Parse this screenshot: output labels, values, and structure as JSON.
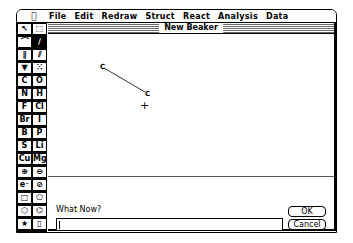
{
  "menubar": {
    "apple_icon": "",
    "items": [
      "File",
      "Edit",
      "Redraw",
      "Struct",
      "React",
      "Analysis",
      "Data"
    ]
  },
  "palette": {
    "rows": [
      [
        {
          "label": "↖",
          "name": "arrow-select-tool"
        },
        {
          "label": "⬚",
          "name": "marquee-select-tool"
        }
      ],
      [
        {
          "label": "⌒",
          "name": "lasso-tool"
        },
        {
          "label": "∕",
          "name": "single-bond-tool",
          "selected": true
        }
      ],
      [
        {
          "label": "∥",
          "name": "double-bond-tool"
        },
        {
          "label": "⫽",
          "name": "triple-bond-tool"
        }
      ],
      [
        {
          "label": "▼",
          "name": "wedge-bond-tool"
        },
        {
          "label": "⁙",
          "name": "hash-bond-tool"
        }
      ],
      [
        {
          "label": "C",
          "name": "carbon-tool"
        },
        {
          "label": "O",
          "name": "oxygen-tool"
        }
      ],
      [
        {
          "label": "N",
          "name": "nitrogen-tool"
        },
        {
          "label": "H",
          "name": "hydrogen-tool"
        }
      ],
      [
        {
          "label": "F",
          "name": "fluorine-tool"
        },
        {
          "label": "Cl",
          "name": "chlorine-tool"
        }
      ],
      [
        {
          "label": "Br",
          "name": "bromine-tool"
        },
        {
          "label": "I",
          "name": "iodine-tool"
        }
      ],
      [
        {
          "label": "B",
          "name": "boron-tool"
        },
        {
          "label": "P",
          "name": "phosphorus-tool"
        }
      ],
      [
        {
          "label": "S",
          "name": "sulfur-tool"
        },
        {
          "label": "Li",
          "name": "lithium-tool"
        }
      ],
      [
        {
          "label": "Cu",
          "name": "copper-tool"
        },
        {
          "label": "Mg",
          "name": "magnesium-tool"
        }
      ],
      [
        {
          "label": "⊕",
          "name": "positive-charge-tool"
        },
        {
          "label": "⊖",
          "name": "negative-charge-tool"
        }
      ],
      [
        {
          "label": "e⁻",
          "name": "electron-tool"
        },
        {
          "label": "⊘",
          "name": "eraser-tool"
        }
      ],
      [
        {
          "label": "□",
          "name": "ring4-tool"
        },
        {
          "label": "⬠",
          "name": "ring5-tool"
        }
      ],
      [
        {
          "label": "⬡",
          "name": "ring6-tool"
        },
        {
          "label": "⌬",
          "name": "benzene-tool"
        }
      ],
      [
        {
          "label": "★",
          "name": "star-tool"
        },
        {
          "label": "▯",
          "name": "template-tool"
        }
      ]
    ]
  },
  "window": {
    "title": "New Beaker"
  },
  "canvas": {
    "atoms": [
      {
        "label": "C",
        "x": 52,
        "y": 30
      },
      {
        "label": "C",
        "x": 97,
        "y": 57
      }
    ],
    "cursor": "+"
  },
  "dialog": {
    "prompt": "What Now?",
    "input_value": "",
    "ok_label": "OK",
    "cancel_label": "Cancel"
  }
}
